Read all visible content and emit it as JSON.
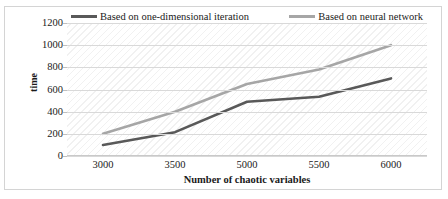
{
  "chart_data": {
    "type": "line",
    "title": "",
    "xlabel": "Number of chaotic variables",
    "ylabel": "time",
    "categories": [
      "3000",
      "3500",
      "5000",
      "5500",
      "6000"
    ],
    "ylim": [
      0,
      1200
    ],
    "yticks": [
      "0",
      "200",
      "400",
      "600",
      "800",
      "1000",
      "1200"
    ],
    "grid": true,
    "legend_position": "top-inside",
    "series": [
      {
        "name": "Based on one-dimensional iteration",
        "color": "#595959",
        "values": [
          100,
          215,
          490,
          535,
          700
        ]
      },
      {
        "name": "Based on neural network",
        "color": "#a6a6a6",
        "values": [
          200,
          400,
          650,
          780,
          1000
        ]
      }
    ]
  }
}
